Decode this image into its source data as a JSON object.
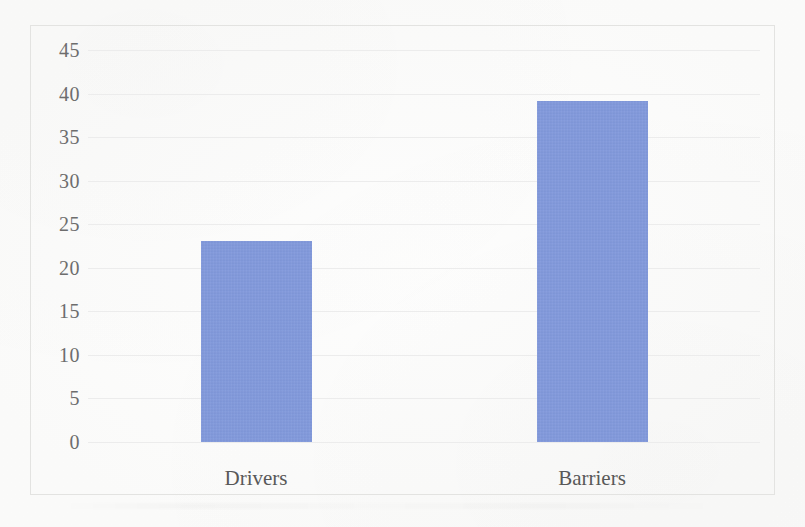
{
  "figure": {
    "background_color": "#fdfdfc",
    "frame_color": "#e3e3e1",
    "gridline_color": "#ececec",
    "tick_text_color": "#6d6d6d",
    "category_text_color": "#585858"
  },
  "chart_data": {
    "type": "bar",
    "title": "",
    "subtitle": "",
    "xlabel": "",
    "ylabel": "",
    "categories": [
      "Drivers",
      "Barriers"
    ],
    "values": [
      23.1,
      39.2
    ],
    "series": [
      {
        "name": "Count",
        "color": "#8098dc",
        "values": [
          23.1,
          39.2
        ]
      }
    ],
    "ylim": [
      0,
      45
    ],
    "ytick_values": [
      0,
      5,
      10,
      15,
      20,
      25,
      30,
      35,
      40,
      45
    ],
    "ytick_labels": [
      "0",
      "5",
      "10",
      "15",
      "20",
      "25",
      "30",
      "35",
      "40",
      "45"
    ],
    "ytick_step": 5,
    "grid": true,
    "grid_axis": "y",
    "legend": false,
    "legend_position": "none",
    "annotations": [],
    "bar_color": "#8098dc"
  }
}
